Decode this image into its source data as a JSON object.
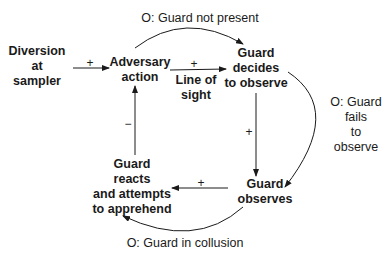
{
  "diagram": {
    "type": "causal-loop",
    "nodes": {
      "diversion": "Diversion\nat\nsampler",
      "adversary_action": "Adversary\naction",
      "guard_decides": "Guard\ndecides\nto observe",
      "guard_observes": "Guard\nobserves",
      "guard_reacts": "Guard\nreacts\nand attempts\nto apprehend"
    },
    "edge_labels": {
      "line_of_sight": "Line of\nsight"
    },
    "signs": {
      "diversion_to_action": "+",
      "action_to_decides": "+",
      "decides_to_observes": "+",
      "observes_to_reacts": "+",
      "reacts_to_action": "−"
    },
    "overrides": {
      "not_present": "O: Guard not present",
      "fails_to_observe": "O: Guard\nfails\nto\nobserve",
      "collusion": "O: Guard in collusion"
    },
    "colors": {
      "line": "#1a1a1a",
      "background": "#ffffff"
    }
  }
}
